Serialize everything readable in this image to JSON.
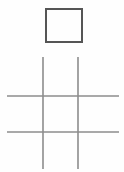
{
  "canvas": {
    "width": 124,
    "height": 172,
    "background_color": "#fefefe",
    "title": "Square and grid line drawing"
  },
  "palette": {
    "square_stroke": "#555555",
    "grid_stroke": "#8d8d8d",
    "background": "#fefefe"
  },
  "shapes": {
    "square": {
      "label": "square",
      "x": 45,
      "y": 8,
      "width": 38,
      "height": 35,
      "stroke_width": 2,
      "stroke_color": "#555555",
      "fill": "none"
    },
    "grid": {
      "label": "grid",
      "stroke_color": "#8d8d8d",
      "stroke_width": 1.6,
      "vertical_lines": [
        {
          "label": "vertical-line-left",
          "x": 43,
          "y1": 57,
          "y2": 169
        },
        {
          "label": "vertical-line-right",
          "x": 78,
          "y1": 57,
          "y2": 169
        }
      ],
      "horizontal_lines": [
        {
          "label": "horizontal-line-top",
          "y": 96,
          "x1": 7,
          "x2": 119
        },
        {
          "label": "horizontal-line-bottom",
          "y": 132,
          "x1": 7,
          "x2": 119
        }
      ]
    }
  }
}
